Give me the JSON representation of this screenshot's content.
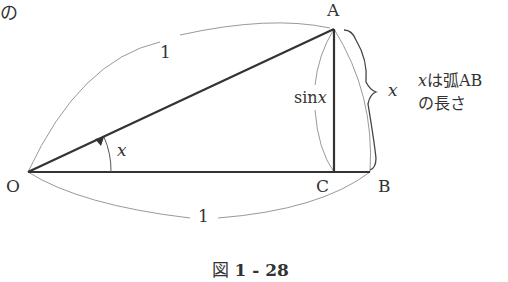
{
  "corner_text": "の",
  "points": {
    "O": {
      "label": "O",
      "x": 28,
      "y": 172
    },
    "A": {
      "label": "A",
      "x": 334,
      "y": 29
    },
    "B": {
      "label": "B",
      "x": 370,
      "y": 172
    },
    "C": {
      "label": "C",
      "x": 334,
      "y": 172
    }
  },
  "labels": {
    "radius_top": "1",
    "radius_bottom": "1",
    "angle": "x",
    "sin": "sinx",
    "sin_prefix": "sin",
    "sin_var": "x",
    "arc_brace": "x",
    "note_line1_var": "x",
    "note_line1_rest": "は弧AB",
    "note_line2": "の長さ"
  },
  "caption": {
    "prefix": "図",
    "number": "1 - 28"
  },
  "colors": {
    "thick_line": "#333333",
    "thin_line": "#888888",
    "text": "#333333"
  }
}
